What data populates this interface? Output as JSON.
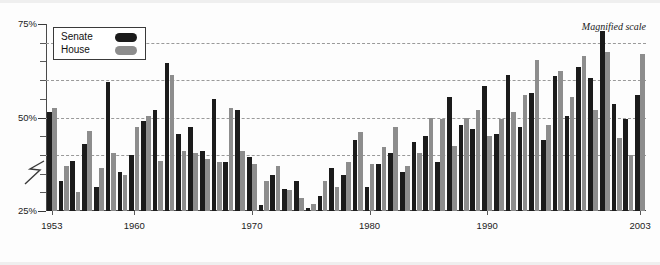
{
  "annotation": {
    "magnified_scale": "Magnified scale"
  },
  "legend": {
    "position": "top-left-inside",
    "entries": [
      {
        "label": "Senate",
        "color": "#1b1b1b",
        "swatch": "rounded-pill"
      },
      {
        "label": "House",
        "color": "#8d8d8d",
        "swatch": "rounded-pill"
      }
    ]
  },
  "axis": {
    "y_labels": [
      "75%",
      "50%",
      "25%"
    ],
    "y_break_symbol": "Z",
    "x_labels": [
      "1953",
      "1960",
      "1970",
      "1980",
      "1990",
      "2003"
    ]
  },
  "chart_data": {
    "type": "bar",
    "title": "",
    "subtitle": "",
    "xlabel": "",
    "ylabel": "",
    "ylim": [
      25,
      75
    ],
    "yticks_major": [
      25,
      50,
      75
    ],
    "yticks_minor": [
      30,
      35,
      40,
      45,
      55,
      60,
      65,
      70
    ],
    "gridlines": [
      40,
      50,
      60,
      70
    ],
    "grid": true,
    "axis_break": true,
    "legend_position": "top-left",
    "annotations": [
      {
        "text": "Magnified scale",
        "position": "top-right",
        "italic": true
      }
    ],
    "categories": [
      "1953",
      "1954",
      "1955",
      "1956",
      "1957",
      "1958",
      "1959",
      "1960",
      "1961",
      "1962",
      "1963",
      "1964",
      "1965",
      "1966",
      "1967",
      "1968",
      "1969",
      "1970",
      "1971",
      "1972",
      "1973",
      "1974",
      "1975",
      "1976",
      "1977",
      "1978",
      "1979",
      "1980",
      "1981",
      "1982",
      "1983",
      "1984",
      "1985",
      "1986",
      "1987",
      "1988",
      "1989",
      "1990",
      "1991",
      "1992",
      "1993",
      "1994",
      "1995",
      "1996",
      "1997",
      "1998",
      "1999",
      "2000",
      "2001",
      "2002",
      "2003"
    ],
    "xtick_labels": {
      "1953": "1953",
      "1960": "1960",
      "1970": "1970",
      "1980": "1980",
      "1990": "1990",
      "2003": "2003"
    },
    "series": [
      {
        "name": "Senate",
        "color": "#1b1b1b",
        "values": [
          51.5,
          33.0,
          38.5,
          43.0,
          31.5,
          59.5,
          35.5,
          40.0,
          49.0,
          52.0,
          64.5,
          45.5,
          47.5,
          41.0,
          55.0,
          38.0,
          52.0,
          39.5,
          26.5,
          34.5,
          31.0,
          33.0,
          25.8,
          29.0,
          36.5,
          34.5,
          44.0,
          31.5,
          37.5,
          40.5,
          35.5,
          43.5,
          45.0,
          38.0,
          55.5,
          48.0,
          47.0,
          58.5,
          45.5,
          61.5,
          47.5,
          56.5,
          44.0,
          61.0,
          50.5,
          63.5,
          60.5,
          73.0,
          53.5,
          49.5,
          56.0
        ]
      },
      {
        "name": "House",
        "color": "#8d8d8d",
        "values": [
          52.5,
          37.0,
          30.0,
          46.5,
          36.5,
          40.5,
          34.5,
          47.5,
          50.5,
          38.5,
          61.5,
          41.0,
          40.5,
          39.0,
          38.0,
          52.5,
          41.0,
          37.5,
          33.0,
          37.0,
          30.5,
          28.5,
          27.0,
          33.0,
          31.5,
          38.0,
          46.0,
          37.5,
          42.0,
          47.5,
          37.0,
          40.5,
          50.0,
          49.5,
          42.5,
          50.0,
          52.0,
          45.0,
          49.5,
          51.5,
          56.0,
          65.5,
          48.0,
          62.5,
          55.5,
          66.5,
          52.0,
          67.5,
          44.5,
          40.0,
          67.0
        ]
      }
    ]
  }
}
